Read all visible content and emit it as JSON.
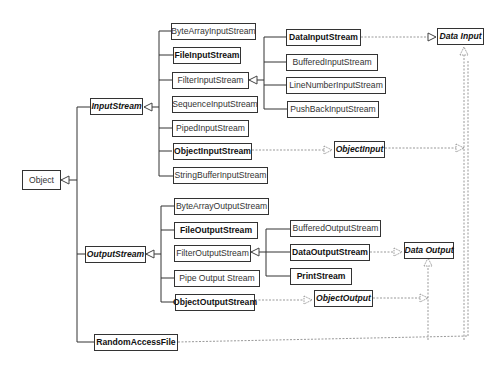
{
  "diagram": {
    "root": "Object",
    "input": {
      "base": "InputStream",
      "children": [
        "ByteArrayInputStream",
        "FileInputStream",
        "FilterInputStream",
        "SequenceInputStream",
        "PipedInputStream",
        "ObjectInputStream",
        "StringBufferInputStream"
      ],
      "filter_children": [
        "DataInputStream",
        "BufferedInputStream",
        "LineNumberInputStream",
        "PushBackInputStream"
      ]
    },
    "output": {
      "base": "OutputStream",
      "children": [
        "ByteArrayOutputStream",
        "FileOutputStream",
        "FilterOutputStream",
        "Pipe Output Stream",
        "ObjectOutputStream"
      ],
      "filter_children": [
        "BufferedOutputStream",
        "DataOutputStream",
        "PrintStream"
      ]
    },
    "other": "RandomAccessFile",
    "interfaces": {
      "data_input": "Data Input",
      "object_input": "ObjectInput",
      "data_output": "Data Output",
      "object_output": "ObjectOutput"
    }
  }
}
